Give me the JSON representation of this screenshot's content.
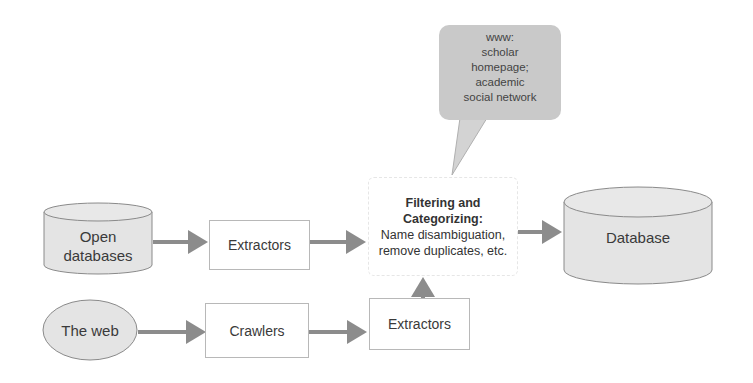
{
  "diagram": {
    "nodes": {
      "open_databases": {
        "label_line1": "Open",
        "label_line2": "databases",
        "shape": "cylinder"
      },
      "extractors_top": {
        "label": "Extractors",
        "shape": "rectangle"
      },
      "the_web": {
        "label": "The web",
        "shape": "ellipse"
      },
      "crawlers": {
        "label": "Crawlers",
        "shape": "rectangle"
      },
      "extractors_bottom": {
        "label": "Extractors",
        "shape": "rectangle"
      },
      "filtering": {
        "title_line1": "Filtering and",
        "title_line2": "Categorizing:",
        "desc_line1": "Name disambiguation,",
        "desc_line2": "remove duplicates, etc.",
        "shape": "rounded-rectangle"
      },
      "database": {
        "label": "Database",
        "shape": "cylinder"
      }
    },
    "callout": {
      "line1": "www:",
      "line2": "scholar",
      "line3": "homepage;",
      "line4": "academic",
      "line5": "social network"
    },
    "edges": [
      {
        "from": "open_databases",
        "to": "extractors_top"
      },
      {
        "from": "extractors_top",
        "to": "filtering"
      },
      {
        "from": "the_web",
        "to": "crawlers"
      },
      {
        "from": "crawlers",
        "to": "extractors_bottom"
      },
      {
        "from": "extractors_bottom",
        "to": "filtering"
      },
      {
        "from": "filtering",
        "to": "database"
      }
    ],
    "colors": {
      "shape_fill": "#e4e4e4",
      "shape_stroke": "#8a8a8a",
      "arrow": "#8c8c8c",
      "callout_fill": "#c9c9c9"
    }
  }
}
